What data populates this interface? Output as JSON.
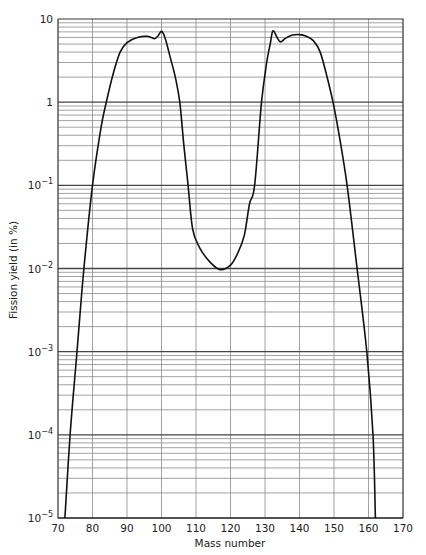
{
  "chart_data": {
    "type": "line",
    "title": "",
    "xlabel": "Mass number",
    "ylabel": "Fission yield (in %)",
    "xlim": [
      70,
      170
    ],
    "ylim": [
      1e-05,
      10
    ],
    "yscale": "log",
    "grid": true,
    "legend": null,
    "x_ticks": [
      70,
      80,
      90,
      100,
      110,
      120,
      130,
      140,
      150,
      160,
      170
    ],
    "y_ticks": [
      {
        "value": 10,
        "label": "10"
      },
      {
        "value": 1,
        "label": "1"
      },
      {
        "value": 0.1,
        "label": "10",
        "exp": "−1"
      },
      {
        "value": 0.01,
        "label": "10",
        "exp": "−2"
      },
      {
        "value": 0.001,
        "label": "10",
        "exp": "−3"
      },
      {
        "value": 0.0001,
        "label": "10",
        "exp": "−4"
      },
      {
        "value": 1e-05,
        "label": "10",
        "exp": "−5"
      }
    ],
    "series": [
      {
        "name": "Fission yield",
        "color": "#111111",
        "points": [
          [
            72,
            1e-05
          ],
          [
            73.5,
            0.0001
          ],
          [
            75.5,
            0.001
          ],
          [
            77.5,
            0.01
          ],
          [
            80,
            0.1
          ],
          [
            82.5,
            0.5
          ],
          [
            84,
            1
          ],
          [
            86,
            2.2
          ],
          [
            88,
            4
          ],
          [
            90,
            5.2
          ],
          [
            93,
            6.0
          ],
          [
            96,
            6.2
          ],
          [
            98,
            5.8
          ],
          [
            99,
            6.3
          ],
          [
            100,
            7.1
          ],
          [
            101,
            6.0
          ],
          [
            102.5,
            3.5
          ],
          [
            104,
            2
          ],
          [
            105.3,
            1
          ],
          [
            106.5,
            0.3
          ],
          [
            107.7,
            0.1
          ],
          [
            109,
            0.03
          ],
          [
            111,
            0.018
          ],
          [
            114,
            0.012
          ],
          [
            117,
            0.0097
          ],
          [
            120,
            0.011
          ],
          [
            122,
            0.015
          ],
          [
            124,
            0.025
          ],
          [
            125.5,
            0.06
          ],
          [
            127,
            0.1
          ],
          [
            129,
            1
          ],
          [
            130.5,
            3
          ],
          [
            131.5,
            5
          ],
          [
            132.3,
            7.2
          ],
          [
            133.5,
            6.0
          ],
          [
            134.5,
            5.3
          ],
          [
            136,
            5.9
          ],
          [
            138,
            6.4
          ],
          [
            140,
            6.5
          ],
          [
            142,
            6.2
          ],
          [
            144,
            5.5
          ],
          [
            146,
            4
          ],
          [
            148,
            2
          ],
          [
            149.7,
            1
          ],
          [
            151.5,
            0.4
          ],
          [
            153.8,
            0.1
          ],
          [
            156.7,
            0.01
          ],
          [
            159.5,
            0.001
          ],
          [
            161.3,
            0.0001
          ],
          [
            162,
            1e-05
          ]
        ]
      }
    ]
  },
  "style": {
    "grid_color": "#8a8a8a",
    "decade_grid_color": "#444444",
    "frame_color": "#333333",
    "line_color": "#111111"
  }
}
